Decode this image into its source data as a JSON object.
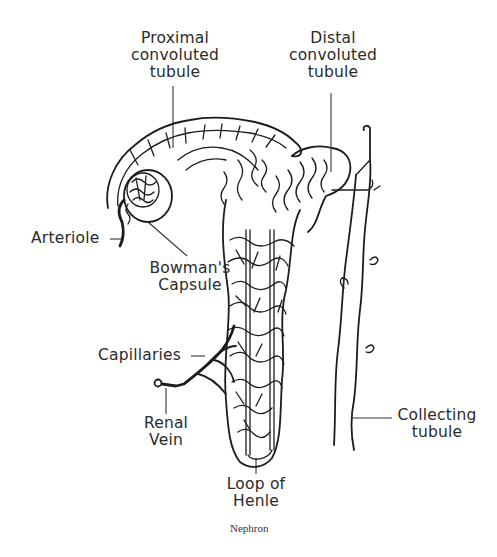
{
  "figure": {
    "caption": "Nephron",
    "labels": {
      "proximal": [
        "Proximal",
        "convoluted",
        "tubule"
      ],
      "distal": [
        "Distal",
        "convoluted",
        "tubule"
      ],
      "arteriole": "Arteriole",
      "bowmans": [
        "Bowman's",
        "Capsule"
      ],
      "capillaries": "Capillaries",
      "renal_vein": [
        "Renal",
        "Vein"
      ],
      "collecting": [
        "Collecting",
        "tubule"
      ],
      "loop": [
        "Loop of",
        "Henle"
      ]
    },
    "colors": {
      "ink": "#1c1c1c",
      "text": "#2b2b2b",
      "background": "#ffffff"
    }
  }
}
